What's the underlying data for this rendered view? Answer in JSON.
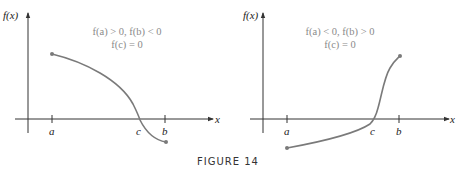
{
  "figure": {
    "caption": "FIGURE 14",
    "curve_color": "#7a7a7a",
    "axis_color": "#333333",
    "annotation_color": "#8a8a8a"
  },
  "panels": [
    {
      "id": "left",
      "y_axis_label": "f(x)",
      "x_axis_label": "x",
      "annotation_line1": "f(a) > 0,  f(b) < 0",
      "annotation_line2": "f(c) = 0",
      "ticks": [
        "a",
        "c",
        "b"
      ],
      "behavior": "decreasing from positive f(a) to negative f(b), crossing zero at c"
    },
    {
      "id": "right",
      "y_axis_label": "f(x)",
      "x_axis_label": "x",
      "annotation_line1": "f(a) < 0,  f(b) > 0",
      "annotation_line2": "f(c) = 0",
      "ticks": [
        "a",
        "c",
        "b"
      ],
      "behavior": "increasing from negative f(a) to positive f(b), crossing zero at c"
    }
  ]
}
